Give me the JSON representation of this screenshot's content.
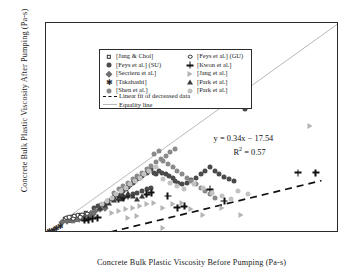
{
  "chart_data": {
    "type": "scatter",
    "title": "",
    "xlabel": "Concrete Bulk Plastic Viscosity Before Pumping (Pa-s)",
    "ylabel": "Concrete Bulk Plastic Viscosity After Pumping (Pa-s)",
    "xlim": [
      0,
      250
    ],
    "ylim": [
      0,
      250
    ],
    "xticks": [
      0,
      50,
      100,
      150,
      200,
      250
    ],
    "yticks": [
      0,
      50,
      100,
      150,
      200,
      250
    ],
    "grid": false,
    "legend_position": "top-left",
    "annotations": [
      {
        "name": "fit-equation",
        "text": "y = 0.34x − 17.54"
      },
      {
        "name": "fit-r2",
        "text_prefix": "R",
        "text_sup": "2",
        "text_suffix": " = 0.57"
      }
    ],
    "fit_line": {
      "label": "Linear fit of decreased data",
      "slope": 0.34,
      "intercept": -17.54,
      "r2": 0.57,
      "style": "dashed",
      "color": "#111111",
      "x_start": 5,
      "x_end": 235
    },
    "equality_line": {
      "label": "Equality line",
      "slope": 1,
      "intercept": 0,
      "style": "solid",
      "color": "#b9b9b9"
    },
    "series": [
      {
        "name": "[Jang & Choi]",
        "marker": "square-open",
        "color": "#2f2f2f",
        "points": [
          [
            16,
            17
          ],
          [
            19,
            18
          ],
          [
            22,
            19
          ],
          [
            25,
            20
          ],
          [
            28,
            20
          ],
          [
            30,
            22
          ],
          [
            33,
            22
          ],
          [
            36,
            20
          ],
          [
            30,
            17
          ],
          [
            25,
            16
          ],
          [
            21,
            15
          ],
          [
            34,
            24
          ]
        ]
      },
      {
        "name": "[Feys et al.] (SU)",
        "marker": "circle-dark",
        "color": "#4b4b4b",
        "points": [
          [
            41,
            30
          ],
          [
            44,
            32
          ],
          [
            47,
            33
          ],
          [
            50,
            35
          ],
          [
            53,
            38
          ],
          [
            56,
            40
          ],
          [
            58,
            43
          ],
          [
            60,
            45
          ],
          [
            62,
            44
          ],
          [
            64,
            47
          ],
          [
            66,
            50
          ],
          [
            68,
            52
          ],
          [
            70,
            55
          ],
          [
            72,
            57
          ],
          [
            74,
            60
          ],
          [
            76,
            62
          ],
          [
            78,
            64
          ],
          [
            80,
            66
          ],
          [
            82,
            68
          ],
          [
            84,
            70
          ],
          [
            86,
            72
          ],
          [
            88,
            74
          ],
          [
            90,
            76
          ],
          [
            92,
            72
          ],
          [
            94,
            70
          ],
          [
            96,
            74
          ],
          [
            99,
            72
          ],
          [
            102,
            70
          ],
          [
            105,
            68
          ],
          [
            108,
            66
          ],
          [
            110,
            62
          ],
          [
            113,
            60
          ],
          [
            116,
            58
          ],
          [
            120,
            60
          ],
          [
            124,
            63
          ],
          [
            128,
            66
          ],
          [
            132,
            70
          ],
          [
            136,
            74
          ],
          [
            140,
            78
          ],
          [
            144,
            74
          ],
          [
            148,
            70
          ],
          [
            152,
            67
          ],
          [
            156,
            64
          ],
          [
            160,
            62
          ],
          [
            170,
            148
          ],
          [
            64,
            40
          ],
          [
            66,
            42
          ],
          [
            70,
            44
          ],
          [
            74,
            46
          ],
          [
            78,
            48
          ],
          [
            82,
            50
          ],
          [
            86,
            52
          ],
          [
            90,
            54
          ]
        ]
      },
      {
        "name": "[Secrieru et al.]",
        "marker": "diamond",
        "color": "#6e6e6e",
        "points": [
          [
            14,
            13
          ],
          [
            18,
            14
          ],
          [
            22,
            16
          ],
          [
            26,
            18
          ],
          [
            30,
            20
          ],
          [
            34,
            22
          ],
          [
            38,
            24
          ],
          [
            42,
            26
          ],
          [
            46,
            28
          ],
          [
            50,
            30
          ],
          [
            24,
            15
          ],
          [
            28,
            17
          ],
          [
            32,
            19
          ],
          [
            36,
            21
          ],
          [
            40,
            23
          ]
        ]
      },
      {
        "name": "[Takahashi]",
        "marker": "star",
        "color": "#2b2b2b",
        "points": [
          [
            3,
            2
          ],
          [
            6,
            4
          ],
          [
            9,
            6
          ],
          [
            12,
            8
          ]
        ]
      },
      {
        "name": "[Shen et al.]",
        "marker": "circle-mid",
        "color": "#8a8a8a",
        "points": [
          [
            58,
            48
          ],
          [
            62,
            52
          ],
          [
            66,
            56
          ],
          [
            70,
            60
          ],
          [
            74,
            64
          ],
          [
            78,
            68
          ],
          [
            82,
            72
          ],
          [
            86,
            76
          ],
          [
            90,
            80
          ],
          [
            94,
            84
          ],
          [
            98,
            88
          ],
          [
            102,
            92
          ],
          [
            106,
            96
          ],
          [
            110,
            100
          ],
          [
            92,
            94
          ],
          [
            96,
            98
          ],
          [
            100,
            86
          ],
          [
            104,
            82
          ],
          [
            108,
            78
          ],
          [
            112,
            74
          ],
          [
            116,
            70
          ],
          [
            120,
            66
          ],
          [
            124,
            62
          ],
          [
            128,
            58
          ],
          [
            132,
            54
          ],
          [
            136,
            50
          ],
          [
            140,
            46
          ],
          [
            144,
            42
          ]
        ]
      },
      {
        "name": "[Feys et al.] (GU)",
        "marker": "circle-open",
        "color": "#2f2f2f",
        "points": [
          [
            17,
            18
          ],
          [
            20,
            19
          ],
          [
            24,
            20
          ],
          [
            27,
            21
          ],
          [
            31,
            22
          ],
          [
            35,
            23
          ],
          [
            29,
            19
          ],
          [
            23,
            17
          ]
        ]
      },
      {
        "name": "[Kwon et al.]",
        "marker": "plus",
        "color": "#111111",
        "points": [
          [
            33,
            15
          ],
          [
            36,
            16
          ],
          [
            40,
            17
          ],
          [
            44,
            18
          ],
          [
            62,
            40
          ],
          [
            66,
            42
          ],
          [
            70,
            44
          ],
          [
            86,
            46
          ],
          [
            90,
            48
          ],
          [
            104,
            44
          ],
          [
            112,
            30
          ],
          [
            118,
            32
          ],
          [
            140,
            52
          ],
          [
            152,
            38
          ],
          [
            215,
            72
          ],
          [
            230,
            72
          ]
        ]
      },
      {
        "name": "[Jang et al.]",
        "marker": "triangle-right",
        "color": "#b4b4b4",
        "points": [
          [
            56,
            24
          ],
          [
            62,
            26
          ],
          [
            68,
            28
          ],
          [
            74,
            30
          ],
          [
            80,
            32
          ],
          [
            86,
            34
          ],
          [
            92,
            36
          ],
          [
            100,
            30
          ],
          [
            108,
            34
          ],
          [
            116,
            36
          ],
          [
            124,
            28
          ],
          [
            134,
            22
          ],
          [
            150,
            30
          ],
          [
            166,
            22
          ],
          [
            100,
            6
          ],
          [
            225,
            127
          ],
          [
            70,
            18
          ],
          [
            78,
            20
          ]
        ]
      },
      {
        "name": "[Park et al.]",
        "marker": "triangle-up",
        "color": "#3a3a3a",
        "points": [
          [
            46,
            30
          ],
          [
            50,
            33
          ],
          [
            54,
            36
          ],
          [
            58,
            39
          ],
          [
            62,
            42
          ],
          [
            66,
            45
          ],
          [
            70,
            48
          ],
          [
            74,
            44
          ],
          [
            78,
            40
          ],
          [
            82,
            44
          ]
        ]
      },
      {
        "name": "[Park et al.]",
        "marker": "circle-lite",
        "color": "#c2c2c2",
        "points": [
          [
            48,
            34
          ],
          [
            52,
            38
          ],
          [
            56,
            42
          ],
          [
            60,
            46
          ],
          [
            64,
            50
          ],
          [
            68,
            54
          ],
          [
            72,
            58
          ],
          [
            76,
            62
          ],
          [
            80,
            66
          ],
          [
            84,
            70
          ],
          [
            88,
            74
          ],
          [
            94,
            78
          ],
          [
            100,
            64
          ],
          [
            106,
            60
          ],
          [
            112,
            56
          ],
          [
            118,
            52
          ],
          [
            126,
            58
          ],
          [
            134,
            54
          ],
          [
            142,
            48
          ],
          [
            150,
            44
          ],
          [
            158,
            40
          ],
          [
            164,
            50
          ],
          [
            172,
            46
          ]
        ]
      }
    ]
  },
  "legend": {
    "items": [
      {
        "label": "[Jang & Choi]",
        "marker": "square-open"
      },
      {
        "label": "[Feys et al.] (GU)",
        "marker": "circle-open"
      },
      {
        "label": "[Feys et al.] (SU)",
        "marker": "circle-dark"
      },
      {
        "label": "[Kwon et al.]",
        "marker": "plus"
      },
      {
        "label": "[Secrieru et al.]",
        "marker": "diamond"
      },
      {
        "label": "[Jang et al.]",
        "marker": "triangle-right"
      },
      {
        "label": "[Takahashi]",
        "marker": "star"
      },
      {
        "label": "[Park et al.]",
        "marker": "triangle-up"
      },
      {
        "label": "[Shen et al.]",
        "marker": "circle-mid"
      },
      {
        "label": "[Park et al.]",
        "marker": "circle-lite"
      }
    ],
    "fit_label": "Linear fit of decreased data",
    "equality_label": "Equality line"
  }
}
